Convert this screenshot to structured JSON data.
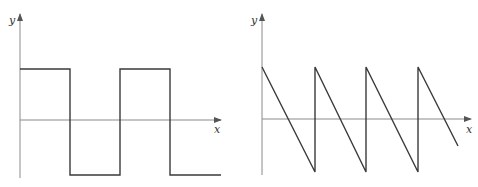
{
  "figures": [
    {
      "name": "square-wave",
      "axis_labels": {
        "x": "x",
        "y": "y"
      },
      "description": "Square wave alternating between a positive and negative constant level"
    },
    {
      "name": "sawtooth-wave",
      "axis_labels": {
        "x": "x",
        "y": "y"
      },
      "description": "Descending sawtooth wave with vertical jumps back to the peak"
    }
  ],
  "colors": {
    "axis": "#8a8a8a",
    "wave": "#3a3a3a"
  }
}
